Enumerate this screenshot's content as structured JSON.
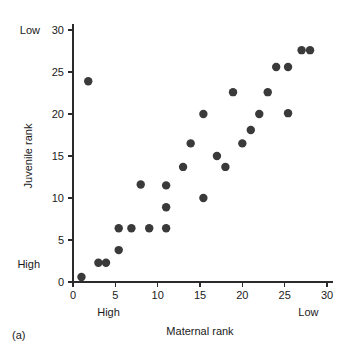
{
  "caption": "(a)",
  "axes": {
    "x": {
      "title": "Maternal rank",
      "ticks": [
        "0",
        "5",
        "10",
        "15",
        "20",
        "25",
        "30"
      ],
      "tick_values": [
        0,
        5,
        10,
        15,
        20,
        25,
        30
      ],
      "range": [
        0,
        30
      ],
      "low_end_label": "High",
      "high_end_label": "Low"
    },
    "y": {
      "title": "Juvenile rank",
      "ticks": [
        "0",
        "5",
        "10",
        "15",
        "20",
        "25",
        "30"
      ],
      "tick_values": [
        0,
        5,
        10,
        15,
        20,
        25,
        30
      ],
      "range": [
        0,
        30
      ],
      "low_end_label": "High",
      "high_end_label": "Low"
    }
  },
  "chart_data": {
    "type": "scatter",
    "title": "",
    "xlabel": "Maternal rank",
    "ylabel": "Juvenile rank",
    "xlim": [
      0,
      30
    ],
    "ylim": [
      0,
      30
    ],
    "grid": false,
    "legend": false,
    "marker_color": "#3a3a3a",
    "marker_size": 4.2,
    "annotations": {
      "x_axis_left": "High",
      "x_axis_right": "Low",
      "y_axis_bottom": "High",
      "y_axis_top": "Low",
      "figure_caption": "(a)"
    },
    "points": [
      {
        "x": 1.0,
        "y": 0.6
      },
      {
        "x": 1.8,
        "y": 23.9
      },
      {
        "x": 3.0,
        "y": 2.3
      },
      {
        "x": 3.9,
        "y": 2.3
      },
      {
        "x": 5.4,
        "y": 3.8
      },
      {
        "x": 5.4,
        "y": 6.4
      },
      {
        "x": 6.9,
        "y": 6.4
      },
      {
        "x": 8.0,
        "y": 11.6
      },
      {
        "x": 9.0,
        "y": 6.4
      },
      {
        "x": 11.0,
        "y": 6.4
      },
      {
        "x": 11.0,
        "y": 8.9
      },
      {
        "x": 11.0,
        "y": 11.5
      },
      {
        "x": 13.0,
        "y": 13.7
      },
      {
        "x": 13.9,
        "y": 16.5
      },
      {
        "x": 15.4,
        "y": 10.0
      },
      {
        "x": 15.4,
        "y": 20.0
      },
      {
        "x": 17.0,
        "y": 15.0
      },
      {
        "x": 18.0,
        "y": 13.7
      },
      {
        "x": 18.9,
        "y": 22.6
      },
      {
        "x": 20.0,
        "y": 16.5
      },
      {
        "x": 21.0,
        "y": 18.1
      },
      {
        "x": 22.0,
        "y": 20.0
      },
      {
        "x": 23.0,
        "y": 22.6
      },
      {
        "x": 24.0,
        "y": 25.6
      },
      {
        "x": 25.4,
        "y": 20.1
      },
      {
        "x": 25.4,
        "y": 25.6
      },
      {
        "x": 27.0,
        "y": 27.6
      },
      {
        "x": 28.0,
        "y": 27.6
      }
    ]
  }
}
